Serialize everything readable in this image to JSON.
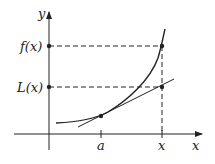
{
  "diagram": {
    "axes": {
      "x_label": "x",
      "y_label": "y"
    },
    "labels": {
      "f_of_x": "f(x)",
      "L_of_x": "L(x)",
      "a_tick": "a",
      "x_tick": "x"
    },
    "elements": [
      {
        "type": "curve",
        "name": "f",
        "description": "increasing convex curve"
      },
      {
        "type": "line",
        "name": "tangent line L at a"
      },
      {
        "type": "point",
        "name": "(a, f(a))",
        "description": "point of tangency"
      },
      {
        "type": "point",
        "name": "(x, f(x))"
      },
      {
        "type": "point",
        "name": "(x, L(x))"
      },
      {
        "type": "dashed-line",
        "name": "horizontal from f(x) to y-axis"
      },
      {
        "type": "dashed-line",
        "name": "horizontal from L(x) to y-axis"
      },
      {
        "type": "dashed-line",
        "name": "vertical from x up to curve"
      }
    ],
    "colors": {
      "stroke": "#222222",
      "background": "#ffffff"
    }
  }
}
